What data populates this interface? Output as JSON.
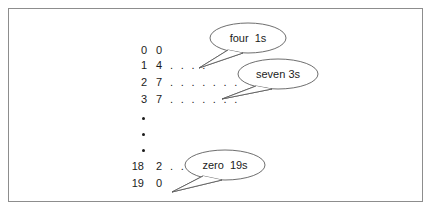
{
  "figure": {
    "frame_color": "#8d8d8d",
    "ink_color": "#1b1b1b",
    "background": "#ffffff"
  },
  "rows": [
    {
      "index": "0",
      "count": "0",
      "dots": ""
    },
    {
      "index": "1",
      "count": "4",
      "dots": ". . . ."
    },
    {
      "index": "2",
      "count": "7",
      "dots": ". . . . . . ."
    },
    {
      "index": "3",
      "count": "7",
      "dots": ". . . . . . ."
    },
    {
      "index": "18",
      "count": "2",
      "dots": ". ."
    },
    {
      "index": "19",
      "count": "0",
      "dots": ""
    }
  ],
  "ellipsis": {
    "symbol": "vertical-ellipsis",
    "dot_count": 3
  },
  "callouts": [
    {
      "id": "four-1s",
      "text": "four  1s"
    },
    {
      "id": "seven-3s",
      "text": "seven 3s"
    },
    {
      "id": "zero-19s",
      "text": "zero  19s"
    }
  ]
}
